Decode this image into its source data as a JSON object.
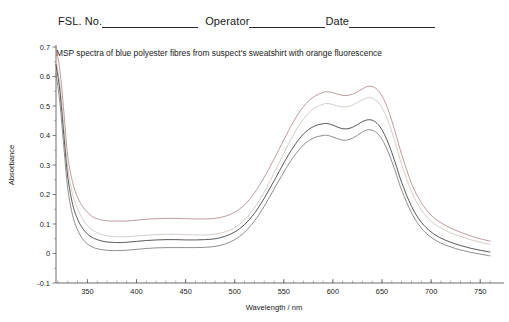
{
  "form_header": {
    "fsl_label": "FSL. No.",
    "fsl_value": "",
    "operator_label": "Operator",
    "operator_value": "",
    "date_label": "Date",
    "date_value": ""
  },
  "chart_data": {
    "type": "line",
    "title": "MSP spectra of blue polyester fibres from suspect's sweatshirt with orange fluorescence",
    "xlabel": "Wavelength / nm",
    "ylabel": "Absorbance",
    "xlim": [
      318,
      762
    ],
    "ylim": [
      -0.1,
      0.7
    ],
    "xticks": [
      350,
      400,
      450,
      500,
      550,
      600,
      650,
      700,
      750
    ],
    "xtick_labels": [
      "350",
      "400",
      "450",
      "500",
      "550",
      "600",
      "650",
      "700",
      "750"
    ],
    "yticks": [
      -0.1,
      0,
      0.1,
      0.2,
      0.3,
      0.4,
      0.5,
      0.6,
      0.7
    ],
    "ytick_labels": [
      "-0.1",
      "0",
      "0.1",
      "0.2",
      "0.3",
      "0.4",
      "0.5",
      "0.6",
      "0.7"
    ],
    "grid": false,
    "legend": "none",
    "x": [
      318,
      322,
      326,
      330,
      335,
      340,
      345,
      350,
      355,
      360,
      365,
      370,
      375,
      380,
      390,
      400,
      410,
      420,
      430,
      440,
      450,
      460,
      470,
      480,
      490,
      500,
      510,
      520,
      530,
      540,
      550,
      560,
      570,
      580,
      590,
      595,
      600,
      605,
      610,
      615,
      620,
      625,
      630,
      635,
      640,
      645,
      650,
      655,
      660,
      665,
      670,
      680,
      690,
      700,
      710,
      720,
      730,
      740,
      750,
      760
    ],
    "series": [
      {
        "name": "fibre-1",
        "color": "#b08a8a",
        "values": [
          0.7,
          0.62,
          0.48,
          0.33,
          0.24,
          0.19,
          0.16,
          0.14,
          0.125,
          0.118,
          0.113,
          0.111,
          0.11,
          0.11,
          0.11,
          0.113,
          0.116,
          0.118,
          0.119,
          0.119,
          0.118,
          0.117,
          0.117,
          0.119,
          0.126,
          0.14,
          0.165,
          0.205,
          0.258,
          0.32,
          0.385,
          0.448,
          0.498,
          0.53,
          0.546,
          0.548,
          0.545,
          0.54,
          0.536,
          0.536,
          0.54,
          0.548,
          0.558,
          0.566,
          0.566,
          0.556,
          0.534,
          0.498,
          0.45,
          0.394,
          0.336,
          0.238,
          0.172,
          0.13,
          0.104,
          0.086,
          0.072,
          0.06,
          0.05,
          0.042
        ]
      },
      {
        "name": "fibre-2",
        "color": "#cfc3bb",
        "values": [
          0.66,
          0.57,
          0.43,
          0.29,
          0.2,
          0.152,
          0.118,
          0.095,
          0.08,
          0.07,
          0.064,
          0.06,
          0.058,
          0.057,
          0.057,
          0.059,
          0.062,
          0.064,
          0.065,
          0.065,
          0.064,
          0.063,
          0.063,
          0.066,
          0.073,
          0.088,
          0.114,
          0.154,
          0.208,
          0.272,
          0.34,
          0.404,
          0.456,
          0.49,
          0.506,
          0.508,
          0.505,
          0.5,
          0.497,
          0.498,
          0.503,
          0.512,
          0.521,
          0.528,
          0.527,
          0.516,
          0.494,
          0.459,
          0.412,
          0.358,
          0.302,
          0.21,
          0.148,
          0.11,
          0.086,
          0.07,
          0.058,
          0.047,
          0.038,
          0.031
        ]
      },
      {
        "name": "fibre-3",
        "color": "#3b3b3b",
        "values": [
          0.64,
          0.55,
          0.4,
          0.26,
          0.166,
          0.116,
          0.086,
          0.066,
          0.054,
          0.047,
          0.042,
          0.039,
          0.038,
          0.037,
          0.038,
          0.041,
          0.044,
          0.046,
          0.047,
          0.047,
          0.046,
          0.046,
          0.047,
          0.05,
          0.058,
          0.073,
          0.098,
          0.136,
          0.187,
          0.246,
          0.307,
          0.362,
          0.405,
          0.43,
          0.44,
          0.44,
          0.435,
          0.428,
          0.423,
          0.423,
          0.428,
          0.437,
          0.447,
          0.453,
          0.452,
          0.441,
          0.419,
          0.385,
          0.342,
          0.292,
          0.241,
          0.16,
          0.106,
          0.073,
          0.052,
          0.038,
          0.027,
          0.018,
          0.011,
          0.005
        ]
      },
      {
        "name": "fibre-4",
        "color": "#7a7a7a",
        "values": [
          0.61,
          0.51,
          0.36,
          0.22,
          0.128,
          0.08,
          0.05,
          0.032,
          0.022,
          0.016,
          0.013,
          0.011,
          0.01,
          0.01,
          0.011,
          0.014,
          0.017,
          0.019,
          0.02,
          0.02,
          0.02,
          0.02,
          0.021,
          0.024,
          0.032,
          0.047,
          0.072,
          0.11,
          0.16,
          0.218,
          0.276,
          0.328,
          0.368,
          0.391,
          0.4,
          0.4,
          0.395,
          0.389,
          0.384,
          0.385,
          0.391,
          0.401,
          0.412,
          0.419,
          0.418,
          0.408,
          0.387,
          0.354,
          0.312,
          0.264,
          0.215,
          0.138,
          0.086,
          0.055,
          0.035,
          0.022,
          0.012,
          0.004,
          -0.002,
          -0.008
        ]
      }
    ]
  }
}
